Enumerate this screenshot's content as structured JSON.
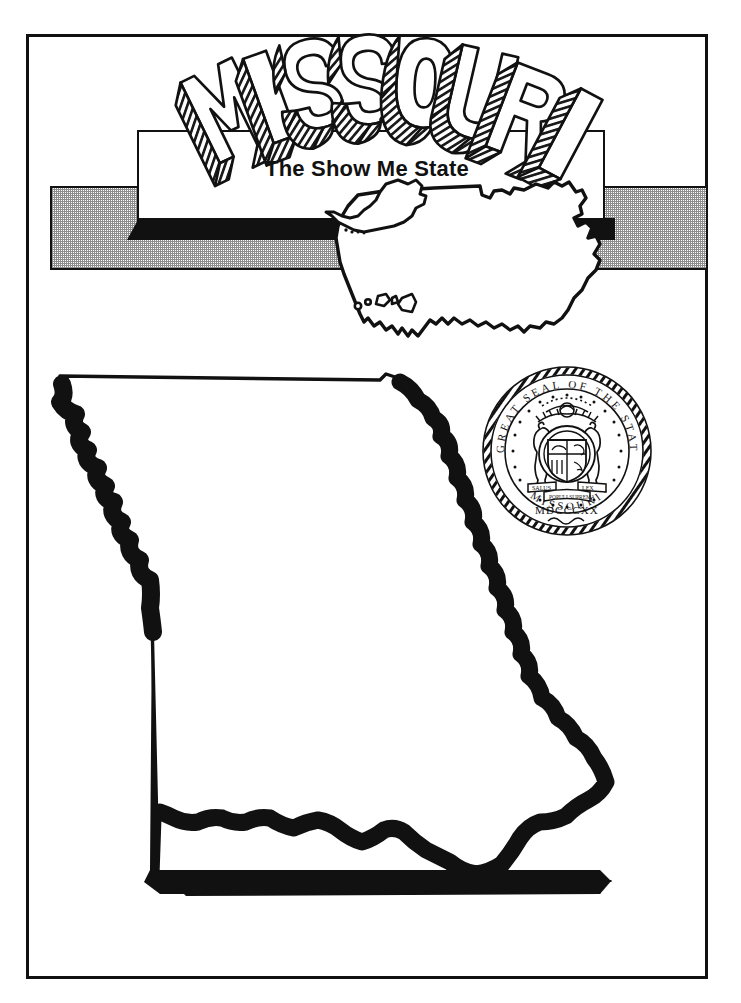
{
  "page": {
    "title": "MISSOURI",
    "subtitle": "The Show Me State",
    "background_color": "#ffffff",
    "ink_color": "#111111",
    "halftone_gray": "#8d8d8d"
  },
  "banner": {
    "state_name": "MISSOURI",
    "nickname": "The Show Me State"
  },
  "seal": {
    "outer_legend": "THE GREAT SEAL OF THE STATE OF MISSOURI",
    "date_roman": "MDCCCXX",
    "motto_inner": "UNITED WE STAND DIVIDED WE FALL",
    "scroll_left": "SALUS",
    "scroll_right": "LEX",
    "supporters": "two grizzly bears",
    "shape": "circular"
  },
  "us_map": {
    "label": "united-states-outline",
    "includes": [
      "contiguous-48",
      "alaska-inset",
      "hawaii-inset"
    ]
  },
  "state_map": {
    "label": "missouri-outline",
    "features": [
      "missouri-river-northwest-border",
      "mississippi-river-eastern-border",
      "bootheel-southeast",
      "straight-western-border",
      "straight-southern-border"
    ]
  }
}
